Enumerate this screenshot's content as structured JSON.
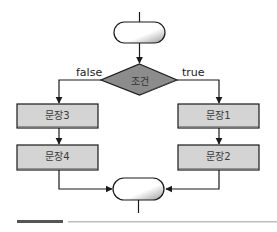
{
  "diagram": {
    "type": "flowchart",
    "decision": {
      "label": "조건",
      "fill": "#8c8c8c"
    },
    "branches": {
      "false": {
        "label": "false",
        "statements": [
          "문장3",
          "문장4"
        ]
      },
      "true": {
        "label": "true",
        "statements": [
          "문장1",
          "문장2"
        ]
      }
    },
    "terminals": {
      "start": "",
      "end": ""
    },
    "colors": {
      "box_fill": "#d4d4d4",
      "box_shadow": "#7a7a7a",
      "line": "#1a1a1a",
      "footer_dark": "#555555",
      "footer_light": "#bdbdbd"
    }
  }
}
